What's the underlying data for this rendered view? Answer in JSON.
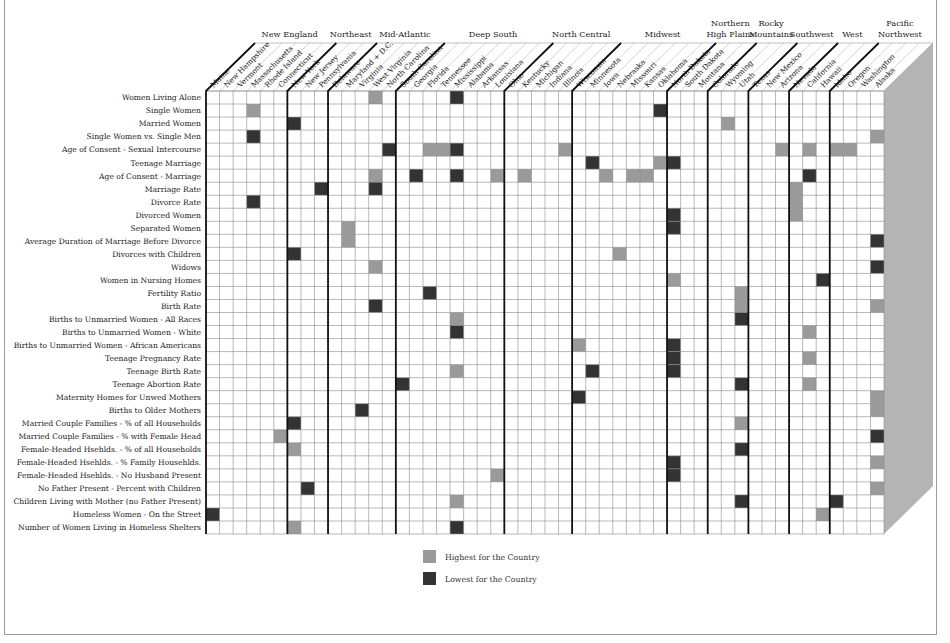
{
  "chart_data": {
    "type": "heatmap",
    "title": "",
    "regions": [
      {
        "name": "New England",
        "lines": [
          "New England"
        ],
        "start": 0,
        "end": 6
      },
      {
        "name": "Northeast",
        "lines": [
          "Northeast"
        ],
        "start": 6,
        "end": 9
      },
      {
        "name": "Mid-Atlantic",
        "lines": [
          "Mid-Atlantic"
        ],
        "start": 9,
        "end": 14
      },
      {
        "name": "Deep South",
        "lines": [
          "Deep South"
        ],
        "start": 14,
        "end": 22
      },
      {
        "name": "North Central",
        "lines": [
          "North Central"
        ],
        "start": 22,
        "end": 27
      },
      {
        "name": "Midwest",
        "lines": [
          "Midwest"
        ],
        "start": 27,
        "end": 34
      },
      {
        "name": "Northern High Plains",
        "lines": [
          "Northern",
          "High Plains"
        ],
        "start": 34,
        "end": 37
      },
      {
        "name": "Rocky Mountains",
        "lines": [
          "Rocky",
          "Mountains"
        ],
        "start": 37,
        "end": 40
      },
      {
        "name": "Southwest",
        "lines": [
          "Southwest"
        ],
        "start": 40,
        "end": 43
      },
      {
        "name": "West",
        "lines": [
          "West"
        ],
        "start": 43,
        "end": 46
      },
      {
        "name": "Pacific Northwest",
        "lines": [
          "Pacific",
          "Northwest"
        ],
        "start": 46,
        "end": 50
      }
    ],
    "columns": [
      "Maine",
      "New Hampshire",
      "Vermont",
      "Massachusetts",
      "Rhode Island",
      "Connecticut",
      "New York",
      "New Jersey",
      "Pennsylvania",
      "Delaware",
      "Maryland + D.C.",
      "Virginia",
      "West Virginia",
      "North Carolina",
      "South Carolina",
      "Georgia",
      "Florida",
      "Tennessee",
      "Mississippi",
      "Alabama",
      "Arkansas",
      "Louisiana",
      "Ohio",
      "Kentucky",
      "Michigan",
      "Indiana",
      "Illinois",
      "Wisconsin",
      "Minnesota",
      "Iowa",
      "Nebraska",
      "Missouri",
      "Kansas",
      "Oklahoma",
      "North Dakota",
      "South Dakota",
      "Montana",
      "Colorado",
      "Wyoming",
      "Utah",
      "Texas",
      "New Mexico",
      "Arizona",
      "Nevada",
      "California",
      "Hawaii",
      "Idaho",
      "Oregon",
      "Washington",
      "Alaska"
    ],
    "rows": [
      {
        "label": "Women Living Alone",
        "highest": [
          "West Virginia"
        ],
        "lowest": [
          "Mississippi"
        ]
      },
      {
        "label": "Single Women",
        "highest": [
          "Massachusetts"
        ],
        "lowest": [
          "Oklahoma"
        ]
      },
      {
        "label": "Married Women",
        "highest": [
          "Wyoming"
        ],
        "lowest": [
          "New York"
        ]
      },
      {
        "label": "Single Women vs. Single Men",
        "highest": [
          "Alaska"
        ],
        "lowest": [
          "Massachusetts"
        ]
      },
      {
        "label": "Age of Consent - Sexual Intercourse",
        "highest": [
          "Florida",
          "Tennessee",
          "Illinois",
          "Arizona",
          "California",
          "Idaho",
          "Oregon"
        ],
        "lowest": [
          "North Carolina",
          "Mississippi"
        ]
      },
      {
        "label": "Teenage Marriage",
        "highest": [
          "Oklahoma"
        ],
        "lowest": [
          "Minnesota",
          "North Dakota"
        ]
      },
      {
        "label": "Age of Consent - Marriage",
        "highest": [
          "West Virginia",
          "Louisiana",
          "Kentucky",
          "Iowa",
          "Missouri",
          "Kansas"
        ],
        "lowest": [
          "Georgia",
          "Mississippi",
          "California"
        ]
      },
      {
        "label": "Marriage Rate",
        "highest": [
          "Nevada"
        ],
        "lowest": [
          "Pennsylvania",
          "West Virginia"
        ]
      },
      {
        "label": "Divorce Rate",
        "highest": [
          "Nevada"
        ],
        "lowest": [
          "Massachusetts"
        ]
      },
      {
        "label": "Divorced Women",
        "highest": [
          "Nevada"
        ],
        "lowest": [
          "North Dakota"
        ]
      },
      {
        "label": "Separated Women",
        "highest": [
          "Maryland + D.C."
        ],
        "lowest": [
          "North Dakota"
        ]
      },
      {
        "label": "Average Duration of Marriage Before Divorce",
        "highest": [
          "Maryland + D.C."
        ],
        "lowest": [
          "Alaska"
        ]
      },
      {
        "label": "Divorces with Children",
        "highest": [
          "Nebraska"
        ],
        "lowest": [
          "New York"
        ]
      },
      {
        "label": "Widows",
        "highest": [
          "West Virginia"
        ],
        "lowest": [
          "Alaska"
        ]
      },
      {
        "label": "Women in Nursing Homes",
        "highest": [
          "North Dakota"
        ],
        "lowest": [
          "Hawaii"
        ]
      },
      {
        "label": "Fertility Ratio",
        "highest": [
          "Utah"
        ],
        "lowest": [
          "Florida"
        ]
      },
      {
        "label": "Birth Rate",
        "highest": [
          "Utah",
          "Alaska"
        ],
        "lowest": [
          "West Virginia"
        ]
      },
      {
        "label": "Births to Unmarried Women - All Races",
        "highest": [
          "Mississippi"
        ],
        "lowest": [
          "Utah"
        ]
      },
      {
        "label": "Births to Unmarried Women - White",
        "highest": [
          "California"
        ],
        "lowest": [
          "Mississippi"
        ]
      },
      {
        "label": "Births to Unmarried Women - African Americans",
        "highest": [
          "Wisconsin"
        ],
        "lowest": [
          "North Dakota"
        ]
      },
      {
        "label": "Teenage Pregnancy Rate",
        "highest": [
          "California"
        ],
        "lowest": [
          "North Dakota"
        ]
      },
      {
        "label": "Teenage Birth Rate",
        "highest": [
          "Mississippi"
        ],
        "lowest": [
          "Minnesota",
          "North Dakota"
        ]
      },
      {
        "label": "Teenage Abortion Rate",
        "highest": [
          "California"
        ],
        "lowest": [
          "South Carolina",
          "Utah"
        ]
      },
      {
        "label": "Maternity Homes for Unwed Mothers",
        "highest": [
          "Alaska"
        ],
        "lowest": [
          "Wisconsin"
        ]
      },
      {
        "label": "Births to Older Mothers",
        "highest": [
          "Alaska"
        ],
        "lowest": [
          "Virginia"
        ]
      },
      {
        "label": "Married Couple Families - % of all Households",
        "highest": [
          "Utah"
        ],
        "lowest": [
          "New York"
        ]
      },
      {
        "label": "Married Couple Families - % with Female Head",
        "highest": [
          "Connecticut"
        ],
        "lowest": [
          "Alaska"
        ]
      },
      {
        "label": "Female-Headed Hsehlds. - % of all Households",
        "highest": [
          "New York"
        ],
        "lowest": [
          "Utah"
        ]
      },
      {
        "label": "Female-Headed Hsehlds. - % Family Househlds.",
        "highest": [
          "Alaska"
        ],
        "lowest": [
          "North Dakota"
        ]
      },
      {
        "label": "Female-Headed Hsehlds. - No Husband Present",
        "highest": [
          "Louisiana"
        ],
        "lowest": [
          "North Dakota"
        ]
      },
      {
        "label": "No Father Present - Percent with Children",
        "highest": [
          "Alaska"
        ],
        "lowest": [
          "New Jersey"
        ]
      },
      {
        "label": "Children Living with Mother (no Father Present)",
        "highest": [
          "Mississippi"
        ],
        "lowest": [
          "Utah",
          "Idaho"
        ]
      },
      {
        "label": "Homeless Women - On the Street",
        "highest": [
          "Hawaii"
        ],
        "lowest": [
          "Maine"
        ]
      },
      {
        "label": "Number of Women Living in Homeless Shelters",
        "highest": [
          "New York"
        ],
        "lowest": [
          "Mississippi"
        ]
      }
    ],
    "legend": [
      {
        "key": "highest",
        "label": "Highest for the Country",
        "color": "#9a9a9a"
      },
      {
        "key": "lowest",
        "label": "Lowest for the Country",
        "color": "#333333"
      }
    ],
    "legend_position": "bottom-center",
    "grid": true
  },
  "colors": {
    "highest": "#9a9a9a",
    "lowest": "#333333",
    "grid_line": "#8a8a8a",
    "region_line": "#111111",
    "side_face": "#b4b4b4",
    "header_face": "#ffffff"
  }
}
